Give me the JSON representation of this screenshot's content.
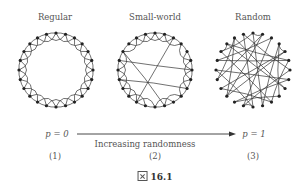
{
  "titles": [
    {
      "text": "Regular",
      "x": 55,
      "y": 12
    },
    {
      "text": "Small-world",
      "x": 155,
      "y": 12
    },
    {
      "text": "Random",
      "x": 253,
      "y": 12
    }
  ],
  "graphs": {
    "node_count": 24,
    "radius": 37,
    "centers": [
      [
        56,
        70
      ],
      [
        155,
        70
      ],
      [
        253,
        70
      ]
    ],
    "node_color": "#222222",
    "edge_color": "#333333",
    "small_world_rewired": [
      [
        2,
        14
      ],
      [
        8,
        17
      ],
      [
        11,
        20
      ],
      [
        19,
        6
      ]
    ],
    "random_edges": [
      [
        0,
        11
      ],
      [
        1,
        15
      ],
      [
        2,
        19
      ],
      [
        3,
        9
      ],
      [
        4,
        16
      ],
      [
        5,
        21
      ],
      [
        6,
        13
      ],
      [
        7,
        18
      ],
      [
        8,
        22
      ],
      [
        9,
        14
      ],
      [
        10,
        20
      ],
      [
        11,
        3
      ],
      [
        12,
        23
      ],
      [
        13,
        2
      ],
      [
        14,
        7
      ],
      [
        15,
        4
      ],
      [
        16,
        10
      ],
      [
        17,
        1
      ],
      [
        18,
        12
      ],
      [
        19,
        5
      ],
      [
        20,
        0
      ],
      [
        21,
        8
      ],
      [
        22,
        17
      ],
      [
        23,
        6
      ],
      [
        0,
        1
      ],
      [
        3,
        4
      ],
      [
        12,
        13
      ],
      [
        20,
        21
      ],
      [
        5,
        10
      ],
      [
        15,
        22
      ]
    ]
  },
  "axis": {
    "start_label": "p = 0",
    "end_label": "p = 1",
    "arrow_caption": "Increasing randomness"
  },
  "indices": [
    {
      "text": "(1)",
      "x": 55
    },
    {
      "text": "(2)",
      "x": 155
    },
    {
      "text": "(3)",
      "x": 253
    }
  ],
  "figure_caption": {
    "icon": "figure-icon",
    "text": "16.1"
  }
}
